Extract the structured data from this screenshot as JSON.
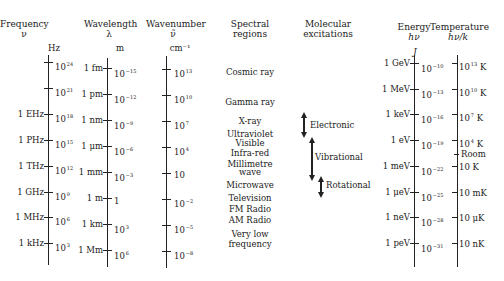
{
  "headers": {
    "frequency": {
      "title": "Frequency",
      "symbol": "ν",
      "unit": "Hz"
    },
    "wavelength": {
      "title": "Wavelength",
      "symbol": "λ",
      "unit": "m"
    },
    "wavenumber": {
      "title": "Wavenumber",
      "symbol": "ν̃",
      "unit": "cm⁻¹"
    },
    "spectral": {
      "title_line1": "Spectral",
      "title_line2": "regions"
    },
    "molecular": {
      "title_line1": "Molecular",
      "title_line2": "excitations"
    },
    "energy": {
      "title": "Energy",
      "symbol": "hν",
      "unit": "J"
    },
    "temperature": {
      "title": "Temperature",
      "symbol": "hν/k"
    }
  },
  "frequency_axis": {
    "ticks": [
      {
        "named": "",
        "base": "10",
        "exp": "24"
      },
      {
        "named": "",
        "base": "10",
        "exp": "21"
      },
      {
        "named": "1 EHz",
        "base": "10",
        "exp": "18"
      },
      {
        "named": "1 PHz",
        "base": "10",
        "exp": "15"
      },
      {
        "named": "1 THz",
        "base": "10",
        "exp": "12"
      },
      {
        "named": "1 GHz",
        "base": "10",
        "exp": "9"
      },
      {
        "named": "1 MHz",
        "base": "10",
        "exp": "6"
      },
      {
        "named": "1 kHz",
        "base": "10",
        "exp": "3"
      }
    ]
  },
  "wavelength_axis": {
    "ticks": [
      {
        "named": "1 fm",
        "base": "10",
        "exp": "−15"
      },
      {
        "named": "1 pm",
        "base": "10",
        "exp": "−12"
      },
      {
        "named": "1 nm",
        "base": "10",
        "exp": "−9"
      },
      {
        "named": "1 μm",
        "base": "10",
        "exp": "−6"
      },
      {
        "named": "1 mm",
        "base": "10",
        "exp": "−3"
      },
      {
        "named": "1 m",
        "base": "1",
        "exp": ""
      },
      {
        "named": "1 km",
        "base": "10",
        "exp": "3"
      },
      {
        "named": "1 Mm",
        "base": "10",
        "exp": "6"
      }
    ]
  },
  "wavenumber_axis": {
    "ticks": [
      {
        "base": "10",
        "exp": "13"
      },
      {
        "base": "10",
        "exp": "10"
      },
      {
        "base": "10",
        "exp": "7"
      },
      {
        "base": "10",
        "exp": "4"
      },
      {
        "base": "10",
        "exp": ""
      },
      {
        "base": "10",
        "exp": "−2"
      },
      {
        "base": "10",
        "exp": "−5"
      },
      {
        "base": "10",
        "exp": "−8"
      }
    ]
  },
  "spectral_regions": [
    "Cosmic ray",
    "Gamma ray",
    "X-ray",
    "Ultraviolet",
    "Visible",
    "Infra-red",
    "Millimetre",
    "wave",
    "Microwave",
    "Television",
    "FM Radio",
    "AM Radio",
    "Very low",
    "frequency"
  ],
  "molecular_excitations": [
    {
      "label": "Electronic"
    },
    {
      "label": "Vibrational"
    },
    {
      "label": "Rotational"
    }
  ],
  "energy_axis": {
    "ticks": [
      {
        "named": "1 GeV",
        "base": "10",
        "exp": "−10"
      },
      {
        "named": "1 MeV",
        "base": "10",
        "exp": "−13"
      },
      {
        "named": "1 keV",
        "base": "10",
        "exp": "−16"
      },
      {
        "named": "1 eV",
        "base": "10",
        "exp": "−19"
      },
      {
        "named": "1 meV",
        "base": "10",
        "exp": "−22"
      },
      {
        "named": "1 μeV",
        "base": "10",
        "exp": "−25"
      },
      {
        "named": "1 neV",
        "base": "10",
        "exp": "−28"
      },
      {
        "named": "1 peV",
        "base": "10",
        "exp": "−31"
      }
    ]
  },
  "temperature_axis": {
    "ticks": [
      {
        "base": "10",
        "exp": "13",
        "suffix": " K"
      },
      {
        "base": "10",
        "exp": "10",
        "suffix": " K"
      },
      {
        "base": "10",
        "exp": "7",
        "suffix": " K"
      },
      {
        "base": "10",
        "exp": "4",
        "suffix": " K"
      },
      {
        "base": "10 K",
        "exp": "",
        "suffix": ""
      },
      {
        "base": "10 mK",
        "exp": "",
        "suffix": ""
      },
      {
        "base": "10 μK",
        "exp": "",
        "suffix": ""
      },
      {
        "base": "10 nK",
        "exp": "",
        "suffix": ""
      }
    ],
    "room_label": "Room"
  }
}
